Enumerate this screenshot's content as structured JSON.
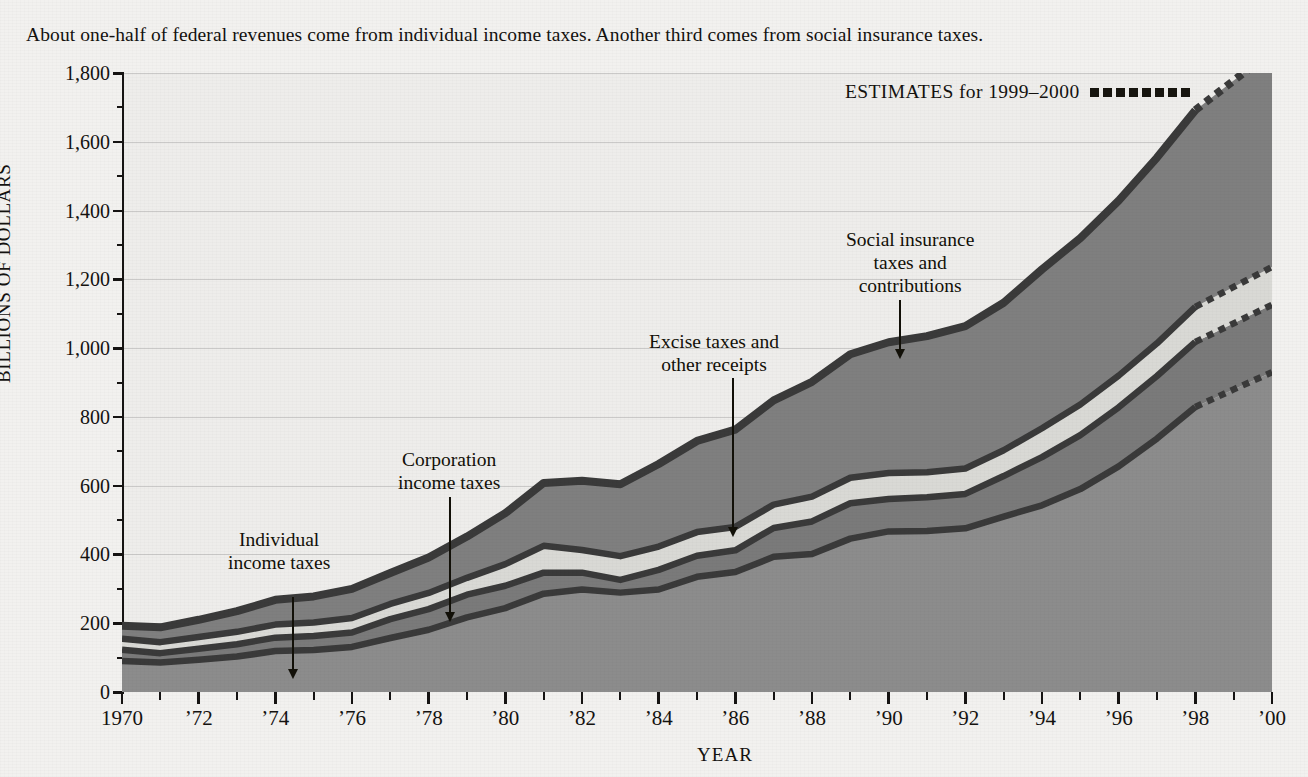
{
  "caption": "About one-half of federal revenues come from individual income taxes. Another third comes from social insurance taxes.",
  "axis": {
    "y_title": "BILLIONS OF DOLLARS",
    "x_title": "YEAR",
    "y_ticks": [
      "0",
      "200",
      "400",
      "600",
      "800",
      "1,000",
      "1,200",
      "1,400",
      "1,600",
      "1,800"
    ],
    "x_ticks": [
      "1970",
      "’72",
      "’74",
      "’76",
      "’78",
      "’80",
      "’82",
      "’84",
      "’86",
      "’88",
      "’90",
      "’92",
      "’94",
      "’96",
      "’98",
      "’00"
    ]
  },
  "legend": {
    "estimates_label": "ESTIMATES for 1999–2000",
    "estimates_marker": "dotted-line-swatch"
  },
  "annotations": [
    {
      "id": "individual",
      "lines": [
        "Individual",
        "income taxes"
      ]
    },
    {
      "id": "corporation",
      "lines": [
        "Corporation",
        "income taxes"
      ]
    },
    {
      "id": "excise",
      "lines": [
        "Excise taxes and",
        "other receipts"
      ]
    },
    {
      "id": "social",
      "lines": [
        "Social insurance",
        "taxes and",
        "contributions"
      ]
    }
  ],
  "colors": {
    "individual": "#8c8c8c",
    "corporation": "#7a7a7a",
    "excise": "#d9d9d5",
    "social": "#7f7f7f",
    "outline": "#3a3a3a",
    "axis": "#151312",
    "paper": "#f2f1ef",
    "plot_bg": "#eeedeb"
  },
  "chart_data": {
    "type": "area",
    "title": "About one-half of federal revenues come from individual income taxes. Another third comes from social insurance taxes.",
    "xlabel": "YEAR",
    "ylabel": "BILLIONS OF DOLLARS",
    "xlim": [
      1970,
      2000
    ],
    "ylim": [
      0,
      1800
    ],
    "grid": true,
    "legend_position": "annotations-inline",
    "stacked": true,
    "x": [
      1970,
      1971,
      1972,
      1973,
      1974,
      1975,
      1976,
      1977,
      1978,
      1979,
      1980,
      1981,
      1982,
      1983,
      1984,
      1985,
      1986,
      1987,
      1988,
      1989,
      1990,
      1991,
      1992,
      1993,
      1994,
      1995,
      1996,
      1997,
      1998,
      1999,
      2000
    ],
    "estimated_years": [
      1999,
      2000
    ],
    "series": [
      {
        "name": "Individual income taxes",
        "values": [
          90,
          86,
          94,
          103,
          119,
          122,
          131,
          157,
          181,
          217,
          244,
          286,
          298,
          289,
          298,
          335,
          349,
          393,
          401,
          446,
          467,
          468,
          476,
          510,
          543,
          590,
          656,
          737,
          829,
          880,
          930
        ]
      },
      {
        "name": "Corporation income taxes",
        "values": [
          33,
          27,
          32,
          36,
          39,
          41,
          42,
          55,
          60,
          66,
          65,
          61,
          49,
          37,
          57,
          61,
          63,
          84,
          95,
          103,
          94,
          98,
          100,
          118,
          140,
          157,
          172,
          182,
          189,
          192,
          196
        ]
      },
      {
        "name": "Excise taxes and other receipts",
        "values": [
          32,
          32,
          34,
          36,
          38,
          39,
          42,
          44,
          47,
          49,
          63,
          78,
          66,
          69,
          68,
          69,
          68,
          68,
          72,
          74,
          76,
          73,
          74,
          75,
          84,
          89,
          92,
          95,
          102,
          106,
          110
        ]
      },
      {
        "name": "Social insurance taxes and contributions",
        "values": [
          38,
          43,
          50,
          60,
          72,
          76,
          85,
          90,
          103,
          120,
          148,
          183,
          201,
          209,
          240,
          265,
          283,
          303,
          334,
          359,
          380,
          396,
          414,
          429,
          462,
          484,
          509,
          540,
          572,
          600,
          628
        ]
      }
    ],
    "totals": [
      193,
      188,
      210,
      235,
      268,
      278,
      300,
      346,
      391,
      452,
      520,
      608,
      614,
      604,
      663,
      730,
      763,
      848,
      902,
      982,
      1017,
      1035,
      1064,
      1132,
      1229,
      1320,
      1429,
      1554,
      1692,
      1778,
      1864
    ],
    "annotations": [
      {
        "text": "Individual income taxes",
        "points_to_series": "Individual income taxes",
        "at_year": 1974
      },
      {
        "text": "Corporation income taxes",
        "points_to_series": "Corporation income taxes",
        "at_year": 1978
      },
      {
        "text": "Excise taxes and other receipts",
        "points_to_series": "Excise taxes and other receipts",
        "at_year": 1985.5
      },
      {
        "text": "Social insurance taxes and contributions",
        "points_to_series": "Social insurance taxes and contributions",
        "at_year": 1990.5
      },
      {
        "text": "ESTIMATES for 1999–2000",
        "points_to_series": null,
        "at_year": null
      }
    ]
  }
}
